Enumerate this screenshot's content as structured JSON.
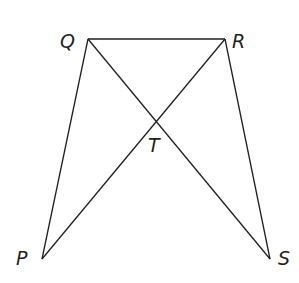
{
  "diagram": {
    "type": "geometry-figure",
    "points": {
      "Q": {
        "label": "Q",
        "x": 88,
        "y": 39
      },
      "R": {
        "label": "R",
        "x": 225,
        "y": 39
      },
      "P": {
        "label": "P",
        "x": 42,
        "y": 259
      },
      "S": {
        "label": "S",
        "x": 270,
        "y": 259
      },
      "T": {
        "label": "T",
        "x": 156,
        "y": 118
      }
    },
    "segments": [
      "QR",
      "QP",
      "QS",
      "RP",
      "RS"
    ],
    "intersection": "T = QS ∩ RP",
    "line_color": "#231f20"
  }
}
